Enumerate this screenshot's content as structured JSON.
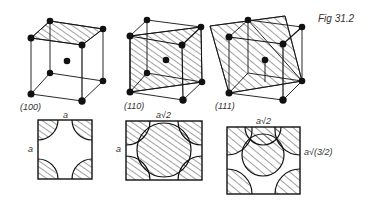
{
  "figure": {
    "caption": "Fig 31.2",
    "colors": {
      "ink": "#111111",
      "label": "#333333",
      "background": "#ffffff"
    },
    "cubes": [
      {
        "plane": "(100)",
        "description": "BCC unit cell with (100) plane shaded on top face"
      },
      {
        "plane": "(110)",
        "description": "BCC unit cell with (110) diagonal plane shaded"
      },
      {
        "plane": "(111)",
        "description": "BCC unit cell with (111) plane shaded"
      }
    ],
    "sections": [
      {
        "plane": "(100)",
        "width_label": "a",
        "height_label": "a"
      },
      {
        "plane": "(110)",
        "width_label": "a√2",
        "height_label": "a"
      },
      {
        "plane": "(111)",
        "width_label": "a√2",
        "height_label": "a√(3/2)"
      }
    ]
  }
}
